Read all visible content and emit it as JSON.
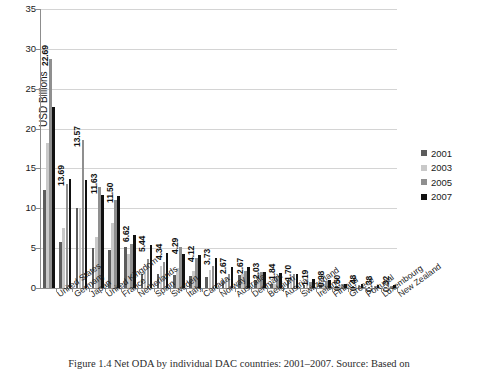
{
  "chart_data": {
    "type": "bar",
    "title": "",
    "xlabel": "",
    "ylabel": "USD Billions",
    "ylim": [
      0,
      35
    ],
    "yticks": [
      0,
      5,
      10,
      15,
      20,
      25,
      30,
      35
    ],
    "grid": true,
    "legend_position": "right",
    "categories": [
      "United States",
      "Germany",
      "Japan",
      "United Kingdom",
      "France",
      "Netherlands",
      "Spain",
      "Sweden",
      "Italy",
      "Canada",
      "Norway",
      "Australia",
      "Denmark",
      "Belgium",
      "Austria",
      "Switzerland",
      "Ireland",
      "Finland",
      "Greece",
      "Portugal",
      "Luxembourg",
      "New Zealand"
    ],
    "series": [
      {
        "name": "2001",
        "color": "#5c5c5c",
        "values": [
          12.3,
          5.8,
          10.0,
          5.0,
          4.8,
          5.1,
          1.75,
          1.8,
          1.6,
          1.55,
          1.35,
          0.9,
          1.65,
          0.95,
          0.55,
          0.95,
          0.35,
          0.4,
          0.25,
          0.28,
          0.16,
          0.14
        ]
      },
      {
        "name": "2003",
        "color": "#c9c9c9",
        "values": [
          18.2,
          7.5,
          10.0,
          6.4,
          8.2,
          4.3,
          2.3,
          2.7,
          2.5,
          2.1,
          2.2,
          1.25,
          1.75,
          1.9,
          0.55,
          1.3,
          0.5,
          0.55,
          0.4,
          0.3,
          0.22,
          0.17
        ]
      },
      {
        "name": "2005",
        "color": "#8f8f8f",
        "values": [
          28.7,
          13.0,
          18.6,
          12.7,
          11.1,
          5.5,
          3.7,
          3.3,
          5.1,
          3.8,
          2.8,
          1.8,
          2.1,
          1.98,
          1.55,
          1.75,
          0.7,
          0.9,
          0.45,
          0.4,
          0.28,
          0.27
        ]
      },
      {
        "name": "2007",
        "color": "#111111",
        "values": [
          22.69,
          13.69,
          13.57,
          11.63,
          11.5,
          6.62,
          5.44,
          4.34,
          4.29,
          4.12,
          3.73,
          2.67,
          2.67,
          2.03,
          1.84,
          1.7,
          1.19,
          0.98,
          0.5,
          0.48,
          0.38,
          0.32
        ]
      }
    ],
    "data_labels": {
      "series": "2007",
      "values": [
        "22.69",
        "13.69",
        "13.57",
        "11.63",
        "11.50",
        "6.62",
        "5.44",
        "4.34",
        "4.29",
        "4.12",
        "3.73",
        "2.67",
        "2.67",
        "2.03",
        "1.84",
        "1.70",
        "1.19",
        "0.98",
        "0.50",
        "0.48",
        "0.38",
        "0.32"
      ]
    }
  },
  "legend": {
    "items": [
      {
        "label": "2001"
      },
      {
        "label": "2003"
      },
      {
        "label": "2005"
      },
      {
        "label": "2007"
      }
    ]
  },
  "caption": {
    "text": "Figure 1.4  Net ODA by individual DAC countries: 2001–2007. Source: Based on"
  }
}
